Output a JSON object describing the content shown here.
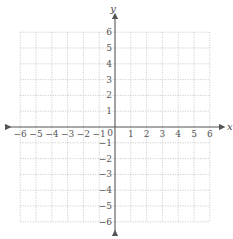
{
  "diagram": {
    "type": "cartesian-coordinate-grid",
    "x_axis": {
      "label": "x",
      "min": -6,
      "max": 6,
      "ticks": [
        -6,
        -5,
        -4,
        -3,
        -2,
        -1,
        1,
        2,
        3,
        4,
        5,
        6
      ]
    },
    "y_axis": {
      "label": "y",
      "min": -6,
      "max": 6,
      "ticks": [
        6,
        5,
        4,
        3,
        2,
        1,
        -1,
        -2,
        -3,
        -4,
        -5,
        -6
      ]
    },
    "origin_label": "0",
    "grid": {
      "style": "dotted",
      "color": "#b8b8b8",
      "step": 1
    },
    "axis_color": "#555555"
  },
  "chart_data": {
    "type": "scatter",
    "title": "",
    "xlabel": "x",
    "ylabel": "y",
    "xlim": [
      -6,
      6
    ],
    "ylim": [
      -6,
      6
    ],
    "grid": true,
    "series": []
  }
}
